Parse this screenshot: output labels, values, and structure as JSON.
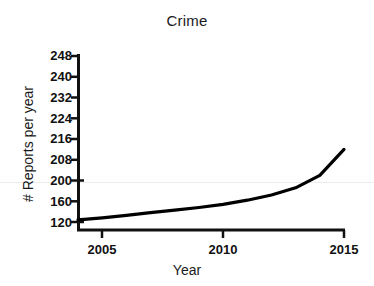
{
  "chart_data": {
    "type": "line",
    "title": "Crime",
    "xlabel": "Year",
    "ylabel": "# Reports per year",
    "grid": false,
    "legend": "none",
    "xlim": [
      2004,
      2015
    ],
    "xticks": [
      2005,
      2010,
      2015
    ],
    "xtick_labels": [
      "2005",
      "2010",
      "2015"
    ],
    "ylim": [
      120,
      248
    ],
    "yticks": [
      248,
      240,
      232,
      224,
      216,
      208,
      200,
      160,
      120
    ],
    "ytick_labels": [
      "248",
      "240",
      "232",
      "224",
      "216",
      "208",
      "200",
      "160",
      "120"
    ],
    "y_axis_note": "broken axis: ticks evenly spaced but 120-160-200 step by 40 while 200-248 step by 8",
    "series": [
      {
        "name": "Crime reports",
        "color": "#000000",
        "x": [
          2004,
          2005,
          2006,
          2007,
          2008,
          2009,
          2010,
          2011,
          2012,
          2013,
          2014,
          2015
        ],
        "values": [
          124,
          128,
          133,
          138,
          143,
          148,
          154,
          162,
          172,
          186,
          202,
          212
        ]
      }
    ]
  },
  "geometry": {
    "plot_left": 78,
    "plot_right": 344,
    "plot_bottom": 230,
    "tick_top": 56,
    "tick_step": 20.75,
    "x_px": {
      "2005": 102,
      "2010": 223,
      "2015": 344
    }
  },
  "colors": {
    "line": "#000000",
    "axis": "#111111",
    "gridline_faint": "#ececec",
    "background": "#ffffff"
  }
}
